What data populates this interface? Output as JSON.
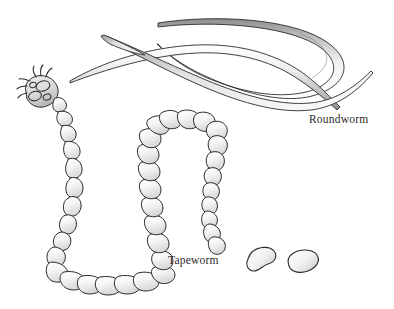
{
  "figure": {
    "background_color": "#ffffff",
    "outline_color": "#2b2b2b",
    "fill_light": "#f4f4f4",
    "fill_shadow": "#9a9a9a",
    "labels": {
      "roundworm": "Roundworm",
      "tapeworm": "Tapeworm"
    },
    "organisms": [
      {
        "name": "Roundworm",
        "description": "Smooth unsegmented ribbon-like nematode body with tapered pointed ends, looped and crossing over itself",
        "label": "Roundworm"
      },
      {
        "name": "Tapeworm",
        "description": "Segmented cestode with scolex bearing hooks and suckers, chain of proglottid segments, and two detached proglottids",
        "label": "Tapeworm",
        "segment_count": 38,
        "detached_proglottids": 2,
        "scolex_suckers": 4,
        "scolex_hooks": 6
      }
    ]
  }
}
